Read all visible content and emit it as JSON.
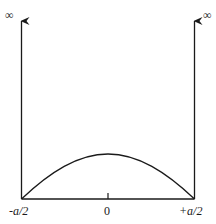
{
  "diagram": {
    "type": "infinite square well wavefunction",
    "labels": {
      "left_infinity": "∞",
      "right_infinity": "∞",
      "left_edge": "-a/2",
      "center": "0",
      "right_edge": "+a/2"
    },
    "colors": {
      "stroke": "#1a1a1a",
      "background": "#ffffff"
    }
  }
}
